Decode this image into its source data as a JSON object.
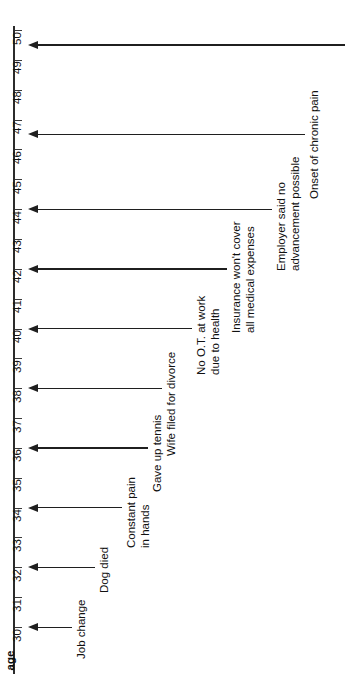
{
  "chart_data": {
    "type": "timeline",
    "title": "",
    "orientation": "vertical-rotated",
    "axis": {
      "name": "age",
      "label": "age",
      "min": 30,
      "max": 50,
      "ticks": [
        30,
        31,
        32,
        33,
        34,
        35,
        36,
        37,
        38,
        39,
        40,
        41,
        42,
        43,
        44,
        45,
        46,
        47,
        48,
        49,
        50
      ],
      "tick_labels": [
        "30",
        "31",
        "32",
        "33",
        "34",
        "35",
        "36",
        "37",
        "38",
        "39",
        "40",
        "41",
        "42",
        "43",
        "44",
        "45",
        "46",
        "47",
        "48",
        "49",
        "50"
      ],
      "direction": "increasing-upward",
      "grid": false
    },
    "xlabel": "age",
    "ylabel": "",
    "legend": null,
    "events": [
      {
        "age": 30.0,
        "label": "Job change",
        "lines": [
          "Job change"
        ]
      },
      {
        "age": 32.0,
        "label": "Dog died",
        "lines": [
          "Dog died"
        ]
      },
      {
        "age": 34.0,
        "label": "Constant pain in hands",
        "lines": [
          "Constant pain",
          "in hands"
        ]
      },
      {
        "age": 36.0,
        "label": "Gave up tennis",
        "lines": [
          "Gave up tennis"
        ]
      },
      {
        "age": 38.0,
        "label": "Wife filed for divorce",
        "lines": [
          "Wife filed for divorce"
        ]
      },
      {
        "age": 40.0,
        "label": "No O.T. at work due to health",
        "lines": [
          "No O.T. at work",
          "due to health"
        ]
      },
      {
        "age": 42.0,
        "label": "Insurance won't cover all medical expenses",
        "lines": [
          "Insurance won't cover",
          "all medical expenses"
        ]
      },
      {
        "age": 44.0,
        "label": "Employer said no advancement possible",
        "lines": [
          "Employer said no",
          "advancement possible"
        ]
      },
      {
        "age": 46.5,
        "label": "Onset of chronic pain",
        "lines": [
          "Onset of chronic pain"
        ]
      },
      {
        "age": 49.5,
        "label": "Arthritis diagnosis",
        "lines": [
          "Arthritis diagnosis"
        ]
      }
    ]
  },
  "colors": {
    "axis": "#2b2b2b",
    "arrow": "#1f1f1f",
    "text": "#111111",
    "background": "#ffffff"
  }
}
